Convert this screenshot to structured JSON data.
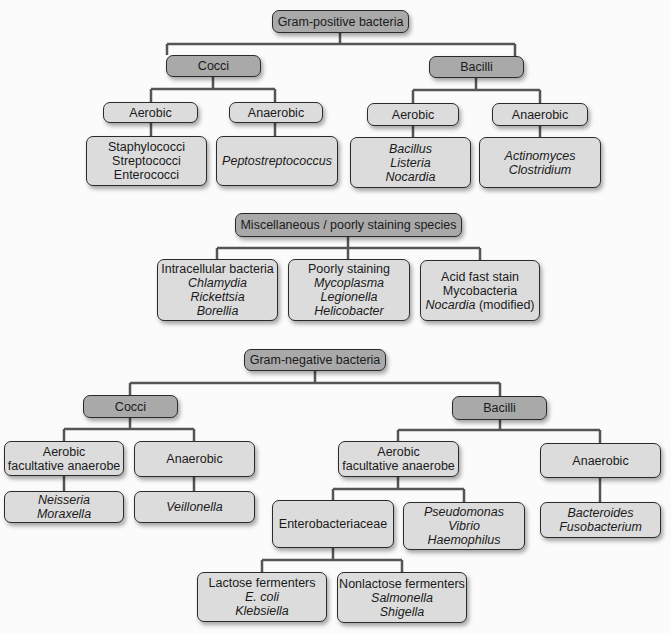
{
  "diagram": {
    "gram_positive": {
      "title": "Gram-positive bacteria",
      "cocci": {
        "label": "Cocci",
        "aerobic": {
          "label": "Aerobic",
          "examples": [
            "Staphylococci",
            "Streptococci",
            "Enterococci"
          ]
        },
        "anaerobic": {
          "label": "Anaerobic",
          "examples": [
            "Peptostreptococcus"
          ]
        }
      },
      "bacilli": {
        "label": "Bacilli",
        "aerobic": {
          "label": "Aerobic",
          "examples": [
            "Bacillus",
            "Listeria",
            "Nocardia"
          ]
        },
        "anaerobic": {
          "label": "Anaerobic",
          "examples": [
            "Actinomyces",
            "Clostridium"
          ]
        }
      }
    },
    "misc": {
      "title": "Miscellaneous / poorly staining species",
      "intracellular": {
        "label": "Intracellular bacteria",
        "examples": [
          "Chlamydia",
          "Rickettsia",
          "Borellia"
        ]
      },
      "poorly_staining": {
        "label": "Poorly staining",
        "examples": [
          "Mycoplasma",
          "Legionella",
          "Helicobacter"
        ]
      },
      "acid_fast": {
        "label": "Acid fast stain",
        "line2": "Mycobacteria",
        "line3_italic": "Nocardia",
        "line3_suffix": " (modified)"
      }
    },
    "gram_negative": {
      "title": "Gram-negative bacteria",
      "cocci": {
        "label": "Cocci",
        "aerobic": {
          "label_line1": "Aerobic",
          "label_line2": "facultative anaerobe",
          "examples": [
            "Neisseria",
            "Moraxella"
          ]
        },
        "anaerobic": {
          "label": "Anaerobic",
          "examples": [
            "Veillonella"
          ]
        }
      },
      "bacilli": {
        "label": "Bacilli",
        "aerobic": {
          "label_line1": "Aerobic",
          "label_line2": "facultative anaerobe",
          "enterobacteriaceae": {
            "label": "Enterobacteriaceae",
            "lactose": {
              "label": "Lactose fermenters",
              "examples": [
                "E. coli",
                "Klebsiella"
              ]
            },
            "nonlactose": {
              "label": "Nonlactose fermenters",
              "examples": [
                "Salmonella",
                "Shigella"
              ]
            }
          },
          "other": {
            "examples": [
              "Pseudomonas",
              "Vibrio",
              "Haemophilus"
            ]
          }
        },
        "anaerobic": {
          "label": "Anaerobic",
          "examples": [
            "Bacteroides",
            "Fusobacterium"
          ]
        }
      }
    }
  }
}
